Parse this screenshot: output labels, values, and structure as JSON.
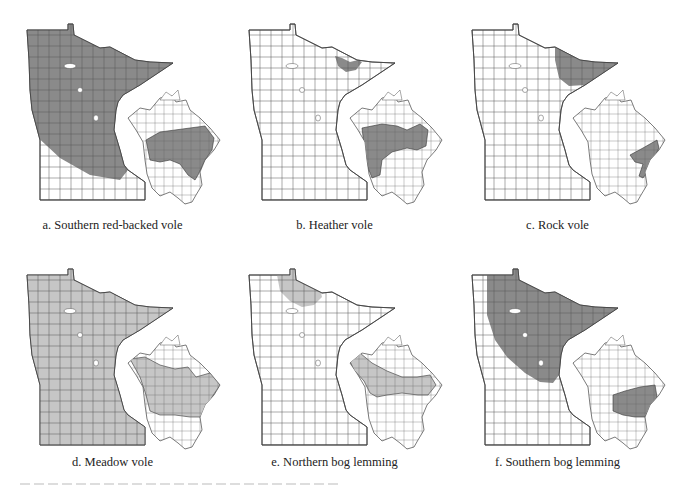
{
  "figure": {
    "colors": {
      "range_dark": "#8a8a8a",
      "range_light": "#c6c6c6",
      "none": "#ffffff",
      "outline": "#444444"
    },
    "panels": [
      {
        "id": "a",
        "caption": "a. Southern red-backed vole",
        "mn_range": "statewide-except-southwest",
        "fill": "dark",
        "na_range": "boreal-canada-and-northeast-us"
      },
      {
        "id": "b",
        "caption": "b. Heather vole",
        "mn_range": "northeast-arrowhead-patch",
        "fill": "dark",
        "na_range": "western-and-boreal-canada"
      },
      {
        "id": "c",
        "caption": "c. Rock vole",
        "mn_range": "northeast-arrowhead",
        "fill": "dark",
        "na_range": "appalachians-and-maritimes"
      },
      {
        "id": "d",
        "caption": "d. Meadow vole",
        "mn_range": "statewide",
        "fill": "light",
        "na_range": "canada-and-northern-us"
      },
      {
        "id": "e",
        "caption": "e. Northern bog lemming",
        "mn_range": "north-central-patch",
        "fill": "light",
        "na_range": "boreal-canada-and-alaska"
      },
      {
        "id": "f",
        "caption": "f. Southern bog lemming",
        "mn_range": "northeast-two-thirds",
        "fill": "dark",
        "na_range": "northeast-us-and-southeast-canada"
      }
    ]
  }
}
